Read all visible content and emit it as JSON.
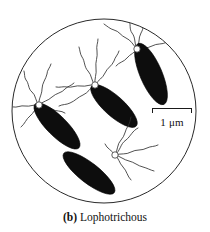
{
  "figure": {
    "kind": "microscopy-illustration",
    "background_color": "#ffffff",
    "outline_color": "#222222",
    "cell_color": "#0d0d0d",
    "flagella_color": "#333333",
    "field_circle": {
      "center_x": 104,
      "center_y": 111,
      "radius": 92
    }
  },
  "scalebar": {
    "label": "1 μm",
    "bar_left_x": 152,
    "bar_right_x": 192,
    "bar_y": 113
  },
  "caption": {
    "letter": "(b)",
    "text": "Lophotrichous",
    "full": "(b) Lophotrichous"
  },
  "cells": [
    {
      "id": "cell-upper-right",
      "center_x": 151,
      "center_y": 74,
      "rx": 33,
      "ry": 11,
      "rotation_deg": 67,
      "pole": "upper-left",
      "flagella_count": 4
    },
    {
      "id": "cell-center",
      "center_x": 114,
      "center_y": 106,
      "rx": 30,
      "ry": 10,
      "rotation_deg": 42,
      "pole": "upper-left",
      "flagella_count": 5
    },
    {
      "id": "cell-left",
      "center_x": 57,
      "center_y": 126,
      "rx": 31,
      "ry": 10,
      "rotation_deg": 45,
      "pole": "upper-left",
      "flagella_count": 5
    },
    {
      "id": "cell-lower",
      "center_x": 89,
      "center_y": 173,
      "rx": 32,
      "ry": 10,
      "rotation_deg": 38,
      "pole": "upper-right",
      "flagella_count": 5
    }
  ]
}
